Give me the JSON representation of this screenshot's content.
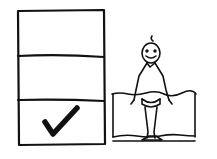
{
  "illustration": {
    "description": "Hand-drawn sketch: a three-row box with a checkmark in the bottom row, next to a stick figure standing in water up to its waist",
    "stroke_color": "#111111",
    "background": "#ffffff",
    "box": {
      "rows": 3,
      "checked_row": 3,
      "icon": "checkmark-icon"
    },
    "figure": {
      "icon": "stick-figure-icon",
      "setting": "water-pool"
    }
  }
}
